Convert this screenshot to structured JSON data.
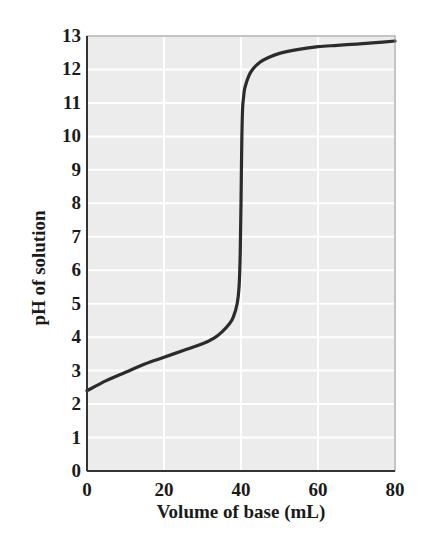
{
  "chart_data": {
    "type": "line",
    "title": "",
    "xlabel": "Volume of base (mL)",
    "ylabel": "pH of solution",
    "xlim": [
      0,
      80
    ],
    "ylim": [
      0,
      13
    ],
    "x_ticks": [
      0,
      20,
      40,
      60,
      80
    ],
    "y_ticks": [
      0,
      1,
      2,
      3,
      4,
      5,
      6,
      7,
      8,
      9,
      10,
      11,
      12,
      13
    ],
    "grid": true,
    "legend": null,
    "colors": {
      "background": "#ececec",
      "grid": "#ffffff",
      "curve": "#2b2b2b",
      "axis": "#333333"
    },
    "series": [
      {
        "name": "Titration curve",
        "x": [
          0,
          5,
          10,
          15,
          20,
          25,
          30,
          33,
          35,
          37,
          38,
          39,
          39.5,
          39.8,
          40,
          40.2,
          40.4,
          40.7,
          41,
          42,
          43,
          45,
          47,
          50,
          55,
          60,
          65,
          70,
          75,
          80
        ],
        "y": [
          2.4,
          2.7,
          2.95,
          3.2,
          3.4,
          3.6,
          3.8,
          3.97,
          4.15,
          4.4,
          4.6,
          5.0,
          5.5,
          6.5,
          8.0,
          9.8,
          10.8,
          11.2,
          11.45,
          11.8,
          12.0,
          12.22,
          12.35,
          12.48,
          12.6,
          12.68,
          12.72,
          12.76,
          12.8,
          12.85
        ]
      }
    ]
  }
}
